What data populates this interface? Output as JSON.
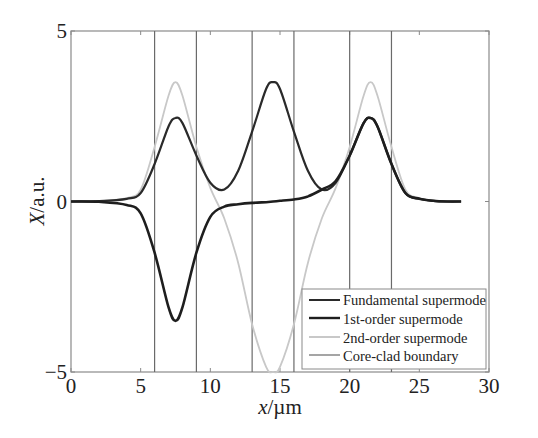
{
  "chart_data": {
    "type": "line",
    "title": "",
    "xlabel": "x/µm",
    "ylabel": "X/a.u.",
    "xlim": [
      0,
      30
    ],
    "ylim": [
      -5,
      5
    ],
    "xticks": [
      0,
      5,
      10,
      15,
      20,
      25,
      30
    ],
    "yticks": [
      -5,
      0,
      5
    ],
    "xtick_labels": [
      "0",
      "5",
      "10",
      "15",
      "20",
      "25",
      "30"
    ],
    "ytick_labels": [
      "−5",
      "0",
      "5"
    ],
    "grid": false,
    "legend_position": "lower right",
    "core_clad_boundaries": [
      6,
      9,
      13,
      16,
      20,
      23
    ],
    "core_centers": [
      7.5,
      14.5,
      21.5
    ],
    "series": [
      {
        "name": "Fundamental supermode",
        "color": "#2a2a2a",
        "x": [
          0,
          2,
          4,
          5,
          6,
          7,
          7.5,
          8,
          9,
          10,
          11,
          12,
          13,
          14,
          14.5,
          15,
          16,
          17,
          18,
          19,
          20,
          21,
          21.5,
          22,
          23,
          24,
          25,
          26,
          27,
          28
        ],
        "y": [
          0,
          0.01,
          0.08,
          0.25,
          1.1,
          2.2,
          2.45,
          2.3,
          1.35,
          0.55,
          0.35,
          0.9,
          2.05,
          3.3,
          3.5,
          3.3,
          2.05,
          0.9,
          0.35,
          0.55,
          1.35,
          2.3,
          2.45,
          2.2,
          1.1,
          0.25,
          0.08,
          0.02,
          0.0,
          0.0
        ]
      },
      {
        "name": "1st-order supermode",
        "color": "#1e1e1e",
        "x": [
          0,
          2,
          4,
          5,
          6,
          7,
          7.5,
          8,
          9,
          10,
          11,
          12,
          13,
          14,
          14.5,
          15,
          16,
          17,
          18,
          19,
          20,
          21,
          21.5,
          22,
          23,
          24,
          25,
          26,
          27,
          28
        ],
        "y": [
          0,
          -0.01,
          -0.1,
          -0.35,
          -1.5,
          -3.1,
          -3.5,
          -3.1,
          -1.5,
          -0.45,
          -0.15,
          -0.08,
          -0.04,
          -0.02,
          0.0,
          0.02,
          0.06,
          0.15,
          0.35,
          0.6,
          1.35,
          2.3,
          2.45,
          2.2,
          1.1,
          0.25,
          0.08,
          0.02,
          0.0,
          0.0
        ]
      },
      {
        "name": "2nd-order supermode",
        "color": "#c8c8c8",
        "x": [
          0,
          2,
          4,
          5,
          6,
          7,
          7.5,
          8,
          9,
          10,
          11,
          12,
          13,
          14,
          14.5,
          15,
          16,
          17,
          18,
          19,
          20,
          21,
          21.5,
          22,
          23,
          24,
          25,
          26,
          27,
          28
        ],
        "y": [
          0,
          0.01,
          0.1,
          0.35,
          1.6,
          3.1,
          3.5,
          3.1,
          1.6,
          0.4,
          -0.5,
          -1.8,
          -3.6,
          -4.85,
          -5.0,
          -4.85,
          -3.6,
          -1.8,
          -0.5,
          0.4,
          1.6,
          3.1,
          3.5,
          3.1,
          1.6,
          0.35,
          0.1,
          0.01,
          0.0,
          0.0
        ]
      },
      {
        "name": "Core-clad boundary",
        "color": "#6a6a6a",
        "type": "vlines",
        "x": [
          6,
          9,
          13,
          16,
          20,
          23
        ]
      }
    ]
  },
  "legend": {
    "items": [
      {
        "label": "Fundamental supermode",
        "color": "#2a2a2a"
      },
      {
        "label": "1st-order supermode",
        "color": "#1e1e1e"
      },
      {
        "label": "2nd-order supermode",
        "color": "#c8c8c8"
      },
      {
        "label": "Core-clad boundary",
        "color": "#6a6a6a"
      }
    ]
  },
  "axes": {
    "xlabel_var": "x",
    "xlabel_unit": "/µm",
    "ylabel_var": "X",
    "ylabel_unit": "/a.u."
  }
}
